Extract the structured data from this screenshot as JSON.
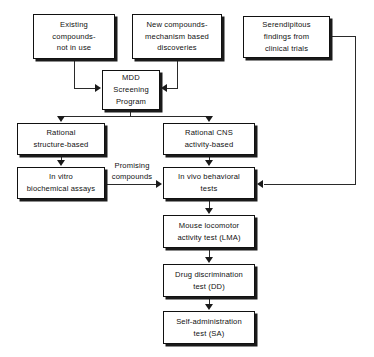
{
  "diagram": {
    "background_color": "#ffffff",
    "line_color": "#2a2a2a",
    "box_border_color": "#111111",
    "box_fill_color": "#ffffff",
    "nodes": [
      {
        "id": "existing",
        "label": "Existing\ncompounds-\nnot in use"
      },
      {
        "id": "new",
        "label": "New compounds-\nmechanism based\ndiscoveries"
      },
      {
        "id": "serend",
        "label": "Serendipitous\nfindings from\nclinical  trials"
      },
      {
        "id": "mdd",
        "label": "MDD\nScreening\nProgram"
      },
      {
        "id": "rational_structure",
        "label": "Rational\nstructure-based"
      },
      {
        "id": "rational_cns",
        "label": "Rational CNS\nactivity-based"
      },
      {
        "id": "invitro",
        "label": "In  vitro\nbiochemical assays"
      },
      {
        "id": "invivo",
        "label": "In  vivo behavioral\ntests"
      },
      {
        "id": "lma",
        "label": "Mouse locomotor\nactivity  test  (LMA)"
      },
      {
        "id": "dd",
        "label": "Drug  discrimination\ntest  (DD)"
      },
      {
        "id": "sa",
        "label": "Self-administration\ntest  (SA)"
      }
    ],
    "edge_labels": [
      {
        "id": "promising",
        "label": "Promising\ncompounds"
      }
    ]
  }
}
